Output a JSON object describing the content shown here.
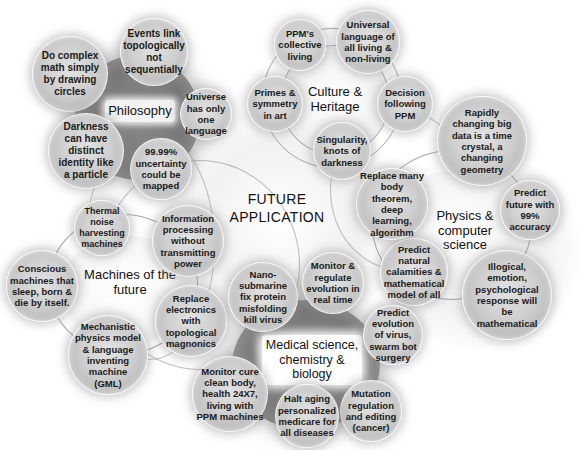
{
  "center": {
    "line1": "FUTURE",
    "line2": "APPLICATION"
  },
  "hubs": {
    "philosophy": {
      "label": "Philosophy"
    },
    "culture": {
      "line1": "Culture &",
      "line2": "Heritage"
    },
    "physics": {
      "line1": "Physics &",
      "line2": "computer",
      "line3": "science"
    },
    "machines": {
      "line1": "Machines of the",
      "line2": "future"
    },
    "medical": {
      "line1": "Medical science,",
      "line2": "chemistry &",
      "line3": "biology"
    }
  },
  "bubbles": {
    "philosophy": [
      "Do complex math  simply by drawing circles",
      "Events link topologically not sequentially",
      "Universe has only one language",
      "99.99% uncertainty could be mapped",
      "Darkness can have distinct identity like a particle"
    ],
    "culture": [
      "PPM's collective living",
      "Universal language of all living & non-living",
      "Decision following PPM",
      "Singularity, knots of darkness",
      "Primes & symmetry in art"
    ],
    "physics": [
      "Rapidly changing big data is  a time crystal, a changing geometry",
      "Predict future with 99% accuracy",
      "Illogical, emotion, psychological response will be mathematical",
      "Predict natural calamities & mathematical model of all",
      "Replace many body theorem, deep learning, algorithm"
    ],
    "machines": [
      "Thermal noise harvesting machines",
      "Information processing without transmitting power",
      "Replace electronics with topological magnonics",
      "Mechanistic physics model & language inventing machine (GML)",
      "Conscious machines that sleep, born & die by itself."
    ],
    "medical": [
      "Nano-submarine fix protein misfolding kill virus",
      "Monitor & regulate evolution in real time",
      "Predict evolution of virus, swarm bot surgery",
      "Mutation regulation and editing (cancer)",
      "Halt aging personalized medicare for all diseases",
      "Monitor cure clean body, health 24X7, living with PPM machines"
    ]
  },
  "colors": {
    "background": "#ffffff",
    "bubble_fill": "#cfcfcf",
    "hub_dark": "#7a7a7a",
    "text": "#111111"
  }
}
